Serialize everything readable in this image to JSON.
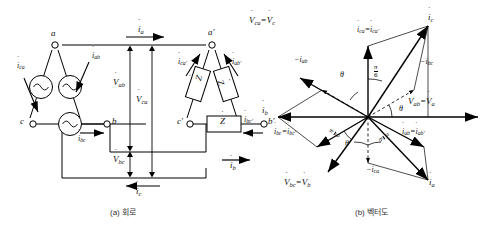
{
  "figure": {
    "captions": {
      "circuit": "(a) 회로",
      "phasor": "(b) 벡터도"
    }
  },
  "circuit": {
    "source": {
      "type": "delta-connected-ac-source",
      "nodes": [
        "a",
        "c",
        "b"
      ],
      "sources": [
        "ac-source-ca",
        "ac-source-ab",
        "ac-source-bc"
      ],
      "phase_currents": [
        "i_ca",
        "i_ab",
        "i_bc"
      ],
      "node_labels": {
        "a": "a",
        "b": "b",
        "c": "c"
      }
    },
    "load": {
      "type": "delta-connected-impedance-load",
      "nodes": [
        "a'",
        "c'",
        "b'"
      ],
      "impedances": [
        "Z",
        "Z",
        "Z"
      ],
      "impedance_label": "Z",
      "phase_currents": [
        "i_ca'",
        "i_ab'",
        "i_bc'"
      ],
      "node_labels": {
        "a": "a′",
        "b": "b′",
        "c": "c′"
      }
    },
    "line_currents": {
      "a": "i_a",
      "b": "i_b",
      "c": "i_c"
    },
    "voltages": {
      "ab": "V_ab",
      "ca": "V_ca",
      "bc": "V_bc"
    },
    "labels": {
      "i_a": "i",
      "i_a_sub": "a",
      "i_b": "i",
      "i_b_sub": "b",
      "i_c": "i",
      "i_c_sub": "c",
      "i_ca": "i",
      "i_ca_sub": "ca",
      "i_ab": "i",
      "i_ab_sub": "ab",
      "i_bc": "i",
      "i_bc_sub": "bc",
      "i_ca_p": "i",
      "i_ca_p_sub": "ca′",
      "i_ab_p": "i",
      "i_ab_p_sub": "ab′",
      "i_bc_p": "i",
      "i_bc_p_sub": "bc′",
      "V_ab": "V",
      "V_ab_sub": "ab",
      "V_ca": "V",
      "V_ca_sub": "ca",
      "V_bc": "V",
      "V_bc_sub": "bc",
      "Z": "Z",
      "node_a": "a",
      "node_b": "b",
      "node_c": "c",
      "node_ap": "a′",
      "node_bp": "b′",
      "node_cp": "c′"
    }
  },
  "phasor": {
    "type": "phasor-diagram",
    "angles": {
      "theta": "θ",
      "pi_over_six_num": "π",
      "pi_over_six_den": "6"
    },
    "vectors": [
      {
        "name": "V_ca_eq_V_c",
        "label_main": "V",
        "label_sub": "ca",
        "label_eq": "=",
        "label_main2": "V",
        "label_sub2": "c",
        "angle_deg": 150,
        "kind": "voltage"
      },
      {
        "name": "V_ab_eq_V_a",
        "label_main": "V",
        "label_sub": "ab",
        "label_eq": "=",
        "label_main2": "V",
        "label_sub2": "a",
        "angle_deg": 0,
        "kind": "voltage"
      },
      {
        "name": "V_bc_eq_V_b",
        "label_main": "V",
        "label_sub": "bc",
        "label_eq": "=",
        "label_main2": "V",
        "label_sub2": "b",
        "angle_deg": 240,
        "kind": "voltage"
      },
      {
        "name": "i_ca_eq_i_ca_prime",
        "label_main": "i",
        "label_sub": "ca",
        "label_eq": "=",
        "label_main2": "i",
        "label_sub2": "ca′",
        "angle_deg": 90,
        "kind": "phase-current"
      },
      {
        "name": "i_ab_eq_i_ab_prime",
        "label_main": "i",
        "label_sub": "ab",
        "label_eq": "=",
        "label_main2": "i",
        "label_sub2": "ab′",
        "angle_deg": -30,
        "kind": "phase-current"
      },
      {
        "name": "i_bc_eq_i_bc_prime",
        "label_main": "i",
        "label_sub": "bc",
        "label_eq": "=",
        "label_main2": "i",
        "label_sub2": "bc′",
        "angle_deg": 210,
        "kind": "phase-current"
      },
      {
        "name": "i_a",
        "label_main": "i",
        "label_sub": "a",
        "angle_deg": -60,
        "kind": "line-current"
      },
      {
        "name": "i_b",
        "label_main": "i",
        "label_sub": "b",
        "angle_deg": 180,
        "kind": "line-current"
      },
      {
        "name": "i_c",
        "label_main": "i",
        "label_sub": "c",
        "angle_deg": 60,
        "kind": "line-current"
      },
      {
        "name": "neg_i_ab",
        "label_main": "−i",
        "label_sub": "ab",
        "angle_deg": 150,
        "kind": "negated-current"
      },
      {
        "name": "neg_i_bc",
        "label_main": "−i",
        "label_sub": "bc",
        "angle_deg": 30,
        "kind": "negated-current"
      },
      {
        "name": "neg_i_ca",
        "label_main": "−i",
        "label_sub": "ca",
        "angle_deg": 270,
        "kind": "negated-current"
      }
    ]
  },
  "colors": {
    "line": "#000000",
    "background": "#ffffff",
    "caption": "#333333"
  }
}
